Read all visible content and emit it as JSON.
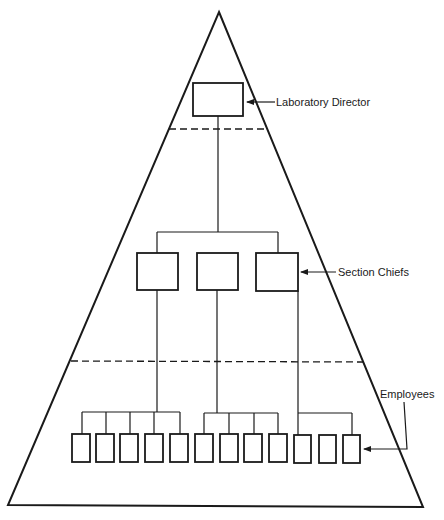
{
  "diagram": {
    "type": "organizational-pyramid",
    "colors": {
      "line": "#1a1a1a",
      "background": "#ffffff"
    },
    "levels": [
      {
        "name": "director",
        "label": "Laboratory Director",
        "box_count": 1
      },
      {
        "name": "section_chiefs",
        "label": "Section Chiefs",
        "box_count": 3
      },
      {
        "name": "employees",
        "label": "Employees",
        "box_count": 12
      }
    ],
    "groups": [
      {
        "chief": 1,
        "employees": 5
      },
      {
        "chief": 2,
        "employees": 4
      },
      {
        "chief": 3,
        "employees": 3
      }
    ]
  }
}
